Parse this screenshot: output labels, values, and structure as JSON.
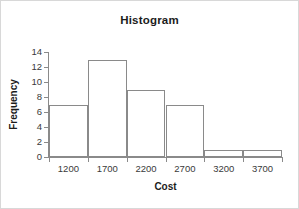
{
  "chart_data": {
    "type": "bar",
    "title": "Histogram",
    "xlabel": "Cost",
    "ylabel": "Frequency",
    "categories": [
      "1200",
      "1700",
      "2200",
      "2700",
      "3200",
      "3700"
    ],
    "values": [
      7,
      13,
      9,
      7,
      1,
      1
    ],
    "ylim": [
      0,
      14
    ],
    "yticks": [
      "0",
      "2",
      "4",
      "6",
      "8",
      "10",
      "12",
      "14"
    ],
    "ytick_values": [
      0,
      2,
      4,
      6,
      8,
      10,
      12,
      14
    ],
    "xticks": [
      "1200",
      "1700",
      "2200",
      "2700",
      "3200",
      "3700"
    ],
    "grid": false,
    "legend": false,
    "bar_fill_color": "#ffffff",
    "bar_edge_color": "#8a8a8a",
    "axis_color": "#8a8a8a",
    "text_color": "#1c1c1c",
    "background_color": "#ffffff",
    "frame_border_color": "#d8d8d8"
  }
}
